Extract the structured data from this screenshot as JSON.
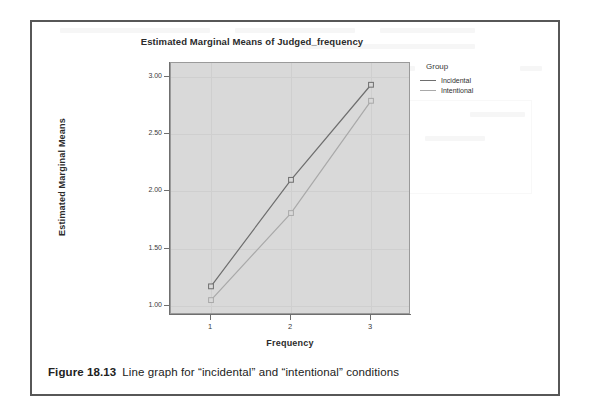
{
  "page": {
    "caption_number": "Figure 18.13",
    "caption_text": "Line graph for “incidental” and “intentional” conditions"
  },
  "chart_data": {
    "type": "line",
    "title": "Estimated Marginal Means of Judged_frequency",
    "xlabel": "Frequency",
    "ylabel": "Estimated Marginal Means",
    "categories": [
      "1",
      "2",
      "3"
    ],
    "x_tick_labels": [
      "1",
      "2",
      "3"
    ],
    "y_tick_labels": [
      "3.00",
      "2.50",
      "2.00",
      "1.50",
      "1.00"
    ],
    "y_tick_values": [
      3.0,
      2.5,
      2.0,
      1.5,
      1.0
    ],
    "ylim": [
      0.92,
      3.12
    ],
    "grid": true,
    "legend_position": "right",
    "legend_title": "Group",
    "series": [
      {
        "name": "Incidental",
        "values": [
          1.17,
          2.1,
          2.93
        ],
        "color": "#6e6e6e"
      },
      {
        "name": "Intentional",
        "values": [
          1.05,
          1.81,
          2.79
        ],
        "color": "#a9a9a9"
      }
    ]
  }
}
